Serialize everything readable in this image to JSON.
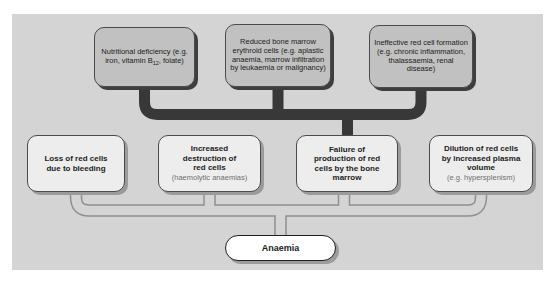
{
  "figure": {
    "panel_background": "#d4d4d4",
    "colors": {
      "top_box_fill": "#c1c1c1",
      "top_box_shadow": "#3e3e3e",
      "middle_box_fill": "#ededed",
      "middle_box_shadow": "#9b9b9b",
      "result_box_fill": "#ffffff",
      "dark_connector": "#383838",
      "tube_connector_outline": "#8f8f8f"
    }
  },
  "top_row": [
    {
      "text_before_sub": "Nutritional deficiency (e.g. iron, vitamin B",
      "subscript": "12",
      "text_after_sub": ", folate)"
    },
    {
      "text": "Reduced bone marrow erythroid cells (e.g. aplastic anaemia, marrow infiltration by leukaemia or malignancy)"
    },
    {
      "text": "Ineffective red cell formation (e.g. chronic inflammation, thalassaemia, renal disease)"
    }
  ],
  "middle_row": [
    {
      "main": "Loss of red cells due to bleeding",
      "note": ""
    },
    {
      "main": "Increased destruction of red cells",
      "note": "(haemolytic anaemias)"
    },
    {
      "main": "Failure of production of red cells by the bone marrow",
      "note": ""
    },
    {
      "main": "Dilution of red cells by increased plasma volume",
      "note": "(e.g. hypersplenism)"
    }
  ],
  "result": {
    "label": "Anaemia"
  }
}
